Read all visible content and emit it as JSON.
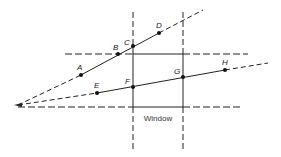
{
  "diagram": {
    "window_label": "Window",
    "colors": {
      "line": "#222222",
      "background": "#ffffff"
    },
    "origin": {
      "x": 18,
      "y": 105
    },
    "window": {
      "left": 133,
      "right": 183,
      "top": 54,
      "bottom": 107
    },
    "points": [
      {
        "label": "A",
        "x": 81,
        "y": 75
      },
      {
        "label": "B",
        "x": 118,
        "y": 54
      },
      {
        "label": "C",
        "x": 133,
        "y": 46
      },
      {
        "label": "D",
        "x": 159,
        "y": 33
      },
      {
        "label": "E",
        "x": 97,
        "y": 93
      },
      {
        "label": "F",
        "x": 133,
        "y": 87
      },
      {
        "label": "G",
        "x": 183,
        "y": 77
      },
      {
        "label": "H",
        "x": 225,
        "y": 70
      }
    ],
    "lines": [
      {
        "name": "upper-ray",
        "from": "origin",
        "through": [
          "A",
          "B",
          "C",
          "D"
        ]
      },
      {
        "name": "lower-ray",
        "from": "origin",
        "through": [
          "E",
          "F",
          "G",
          "H"
        ]
      }
    ]
  }
}
